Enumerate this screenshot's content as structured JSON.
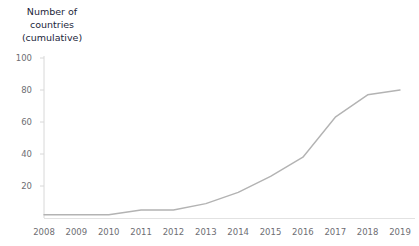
{
  "chart_data": {
    "type": "line",
    "title": "Number of\ncountries\n(cumulative)",
    "title_lines": [
      "Number of",
      "countries",
      "(cumulative)"
    ],
    "xlabel": "",
    "ylabel": "Number of countries (cumulative)",
    "x": [
      2008,
      2009,
      2010,
      2011,
      2012,
      2013,
      2014,
      2015,
      2016,
      2017,
      2018,
      2019
    ],
    "categories": [
      "2008",
      "2009",
      "2010",
      "2011",
      "2012",
      "2013",
      "2014",
      "2015",
      "2016",
      "2017",
      "2018",
      "2019"
    ],
    "values": [
      2,
      2,
      2,
      5,
      5,
      9,
      16,
      26,
      38,
      63,
      77,
      80
    ],
    "series": [
      {
        "name": "Number of countries (cumulative)",
        "values": [
          2,
          2,
          2,
          5,
          5,
          9,
          16,
          26,
          38,
          63,
          77,
          80
        ],
        "color": "#b3b3b3"
      }
    ],
    "xlim": [
      2008,
      2019
    ],
    "ylim": [
      0,
      100
    ],
    "y_ticks": [
      20,
      40,
      60,
      80,
      100
    ],
    "y_tick_labels": [
      "20",
      "40",
      "60",
      "80",
      "100"
    ],
    "x_ticks": [
      2008,
      2009,
      2010,
      2011,
      2012,
      2013,
      2014,
      2015,
      2016,
      2017,
      2018,
      2019
    ],
    "grid": false,
    "legend": false,
    "legend_position": "none",
    "line_color": "#b3b3b3",
    "axis_color": "#d8d8d8",
    "tick_label_color": "#6e6e73",
    "title_color": "#1c1f3b",
    "background_color": "#ffffff"
  }
}
